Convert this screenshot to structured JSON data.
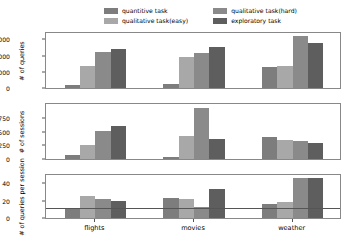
{
  "chart_data": {
    "type": "bar",
    "title": "",
    "layout": "3 stacked subplots sharing x axis, grouped vertical bars",
    "categories": [
      "flights",
      "movies",
      "weather"
    ],
    "xlabel": "",
    "legend_position": "top",
    "grid": false,
    "series_names": [
      "quantitive task",
      "qualitative task(easy)",
      "qualitative task(hard)",
      "exploratory task"
    ],
    "series_colors": [
      "#7d7d7d",
      "#a8a8a8",
      "#8a8a8a",
      "#5e5e5e"
    ],
    "subplots": [
      {
        "id": "queries",
        "ylabel": "# of queries",
        "yticks": [
          0,
          5000,
          10000,
          15000
        ],
        "ylim": [
          0,
          17000
        ],
        "series": [
          {
            "name": "quantitive task",
            "values": [
              900,
              1100,
              6300
            ]
          },
          {
            "name": "qualitative task(easy)",
            "values": [
              6700,
              9400,
              6700
            ]
          },
          {
            "name": "qualitative task(hard)",
            "values": [
              11000,
              10700,
              15900
            ]
          },
          {
            "name": "exploratory task",
            "values": [
              12000,
              12600,
              13700
            ]
          }
        ]
      },
      {
        "id": "sessions",
        "ylabel": "# of sessions",
        "yticks": [
          0,
          250,
          500,
          750
        ],
        "ylim": [
          0,
          1000
        ],
        "series": [
          {
            "name": "quantitive task",
            "values": [
              80,
              45,
              400
            ]
          },
          {
            "name": "qualitative task(easy)",
            "values": [
              255,
              410,
              345
            ]
          },
          {
            "name": "qualitative task(hard)",
            "values": [
              500,
              920,
              330
            ]
          },
          {
            "name": "exploratory task",
            "values": [
              590,
              370,
              295
            ]
          }
        ]
      },
      {
        "id": "queries-per-session",
        "ylabel": "# of queries per session",
        "yticks": [
          0,
          20,
          40
        ],
        "ylim": [
          0,
          50
        ],
        "reference_line": 10.5,
        "series": [
          {
            "name": "quantitive task",
            "values": [
              11,
              23.5,
              16.5
            ]
          },
          {
            "name": "qualitative task(easy)",
            "values": [
              25,
              22,
              19
            ]
          },
          {
            "name": "qualitative task(hard)",
            "values": [
              21.5,
              12.5,
              46
            ]
          },
          {
            "name": "exploratory task",
            "values": [
              19.5,
              34,
              46.5
            ]
          }
        ]
      }
    ]
  },
  "legend": {
    "entries": [
      {
        "label": "quantitive task",
        "color": "#7d7d7d"
      },
      {
        "label": "qualitative task(hard)",
        "color": "#8a8a8a"
      },
      {
        "label": "qualitative task(easy)",
        "color": "#a8a8a8"
      },
      {
        "label": "exploratory task",
        "color": "#5e5e5e"
      }
    ]
  }
}
